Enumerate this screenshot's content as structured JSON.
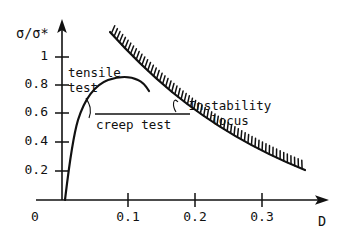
{
  "chart_data": {
    "type": "line",
    "title": "",
    "xlabel": "D",
    "ylabel": "σ/σ*",
    "xlim": [
      0,
      0.36
    ],
    "ylim": [
      0,
      1.12
    ],
    "grid": false,
    "legend": "none",
    "xticks": [
      0,
      0.1,
      0.2,
      0.3
    ],
    "xtick_labels": [
      "0",
      "0.1",
      "0.2",
      "0.3"
    ],
    "yticks": [
      0,
      0.2,
      0.4,
      0.6,
      0.8,
      1
    ],
    "ytick_labels": [
      "0",
      "0.2",
      "0.4",
      "0.6",
      "0.8",
      "1"
    ],
    "series": [
      {
        "name": "tensile test",
        "style": "solid-curve",
        "points": [
          [
            0.005,
            0.0
          ],
          [
            0.012,
            0.15
          ],
          [
            0.018,
            0.32
          ],
          [
            0.025,
            0.47
          ],
          [
            0.032,
            0.6
          ],
          [
            0.042,
            0.71
          ],
          [
            0.055,
            0.79
          ],
          [
            0.07,
            0.835
          ],
          [
            0.085,
            0.855
          ],
          [
            0.1,
            0.855
          ],
          [
            0.108,
            0.845
          ],
          [
            0.115,
            0.825
          ]
        ]
      },
      {
        "name": "creep test",
        "style": "horizontal-line",
        "points": [
          [
            0.05,
            0.6
          ],
          [
            0.2,
            0.6
          ]
        ]
      },
      {
        "name": "Instability locus",
        "style": "hatched-boundary",
        "points": [
          [
            0.072,
            1.06
          ],
          [
            0.1,
            0.9
          ],
          [
            0.13,
            0.78
          ],
          [
            0.16,
            0.68
          ],
          [
            0.2,
            0.58
          ],
          [
            0.24,
            0.49
          ],
          [
            0.28,
            0.41
          ],
          [
            0.32,
            0.34
          ],
          [
            0.36,
            0.29
          ]
        ]
      }
    ],
    "annotations": [
      {
        "text": "tensile",
        "text2": "test",
        "kind": "leader-label",
        "target": [
          0.035,
          0.66
        ]
      },
      {
        "text": "creep test",
        "kind": "inline-label"
      },
      {
        "text": "Instability",
        "text2": "locus",
        "kind": "leader-label",
        "target": [
          0.165,
          0.68
        ]
      }
    ]
  },
  "axes": {
    "y_title": "σ/σ*",
    "x_title": "D",
    "y_tick_labels": [
      "1",
      "0.8",
      "0.6",
      "0.4",
      "0.2"
    ],
    "origin_label": "0",
    "x_tick_labels": [
      "0.1",
      "0.2",
      "0.3"
    ]
  },
  "labels": {
    "tensile_line1": "tensile",
    "tensile_line2": "test",
    "creep": "creep test",
    "instability_line1": "Instability",
    "instability_line2": "locus"
  },
  "colors": {
    "ink": "#111111",
    "background": "#ffffff"
  }
}
